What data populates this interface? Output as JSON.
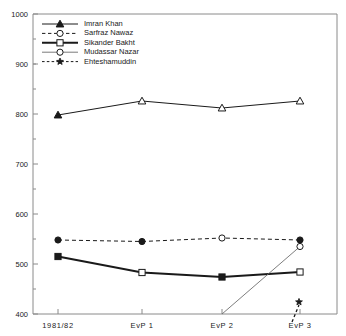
{
  "chart_data": {
    "type": "line",
    "title": "",
    "xlabel": "",
    "ylabel": "",
    "categories": [
      "1981/82",
      "EvP 1",
      "EvP 2",
      "EvP 3"
    ],
    "ylim": [
      400,
      1000
    ],
    "ytick_labels": [
      "400",
      "500",
      "600",
      "700",
      "800",
      "900",
      "1000"
    ],
    "ytick_values": [
      400,
      500,
      600,
      700,
      800,
      900,
      1000
    ],
    "yminor_step": 50,
    "grid": false,
    "legend_position": "top-left",
    "series": [
      {
        "name": "Imran Khan",
        "marker": "triangle",
        "line_style": "solid",
        "color": "#1a1a1a",
        "values": [
          798,
          826,
          812,
          826
        ],
        "marker_filled": [
          true,
          false,
          false,
          false
        ]
      },
      {
        "name": "Sarfraz Nawaz",
        "marker": "circle",
        "line_style": "dashed",
        "color": "#1a1a1a",
        "values": [
          548,
          545,
          552,
          548
        ],
        "marker_filled": [
          true,
          true,
          false,
          true
        ]
      },
      {
        "name": "Sikander Bakht",
        "marker": "square",
        "line_style": "solid",
        "color": "#1a1a1a",
        "values": [
          515,
          483,
          474,
          484
        ],
        "marker_filled": [
          true,
          false,
          true,
          false
        ]
      },
      {
        "name": "Mudassar Nazar",
        "marker": "circle",
        "line_style": "solid",
        "color": "#1a1a1a",
        "values": [
          null,
          null,
          400,
          535
        ],
        "marker_filled": [
          false,
          false,
          false,
          false
        ]
      },
      {
        "name": "Ehteshamuddin",
        "marker": "star",
        "line_style": "dashed",
        "color": "#1a1a1a",
        "values": [
          null,
          null,
          null,
          424
        ],
        "marker_filled": [
          true,
          true,
          true,
          true
        ]
      }
    ]
  },
  "legend": {
    "entries": [
      {
        "label": "Imran Khan"
      },
      {
        "label": "Sarfraz Nawaz"
      },
      {
        "label": "Sikander Bakht"
      },
      {
        "label": "Mudassar Nazar"
      },
      {
        "label": "Ehteshamuddin"
      }
    ]
  },
  "axes": {
    "y_labels": [
      "1000",
      "900",
      "800",
      "700",
      "600",
      "500",
      "400"
    ],
    "x_labels": [
      "1981/82",
      "EvP 1",
      "EvP 2",
      "EvP 3"
    ]
  }
}
